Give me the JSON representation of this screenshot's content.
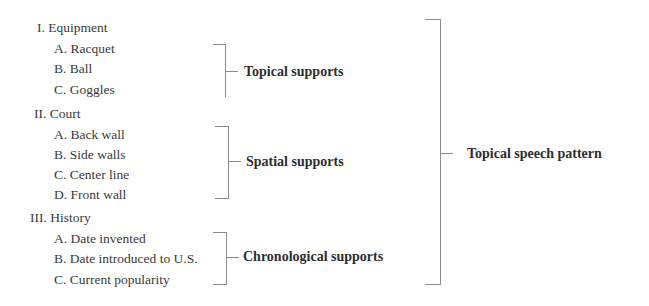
{
  "outline": {
    "sections": [
      {
        "label": "I. Equipment",
        "items": [
          "A. Racquet",
          "B. Ball",
          "C. Goggles"
        ],
        "support_label": "Topical supports"
      },
      {
        "label": "II. Court",
        "items": [
          "A. Back wall",
          "B. Side walls",
          "C. Center line",
          "D. Front wall"
        ],
        "support_label": "Spatial supports"
      },
      {
        "label": "III. History",
        "items": [
          "A. Date invented",
          "B. Date introduced to U.S.",
          "C. Current popularity"
        ],
        "support_label": "Chronological supports"
      }
    ],
    "overall_label": "Topical speech pattern"
  },
  "colors": {
    "text": "#3a3a3a",
    "bracket": "#8a8a8a",
    "background": "#ffffff"
  }
}
